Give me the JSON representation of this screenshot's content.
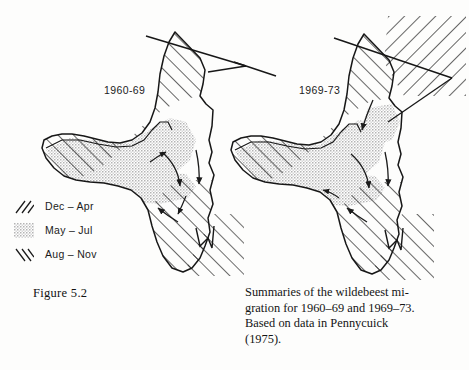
{
  "figure": {
    "number_label": "Figure 5.2",
    "caption_lines": [
      "Summaries of the wildebeest mi-",
      "gration for 1960–69 and 1969–73.",
      "Based on data in Pennycuick",
      "(1975)."
    ]
  },
  "legend": {
    "items": [
      {
        "label": "Dec – Apr",
        "pattern": "forward-hatch",
        "icon": "forward-hatch-swatch-icon"
      },
      {
        "label": "May – Jul",
        "pattern": "stipple",
        "icon": "stipple-swatch-icon"
      },
      {
        "label": "Aug – Nov",
        "pattern": "back-hatch",
        "icon": "back-hatch-swatch-icon"
      }
    ]
  },
  "maps": [
    {
      "id": "map-1960-69",
      "label": "1960-69"
    },
    {
      "id": "map-1969-73",
      "label": "1969-73"
    }
  ],
  "colors": {
    "ink": "#141414",
    "stipple": "#c9c9c9",
    "paper": "#fdfdfc"
  }
}
